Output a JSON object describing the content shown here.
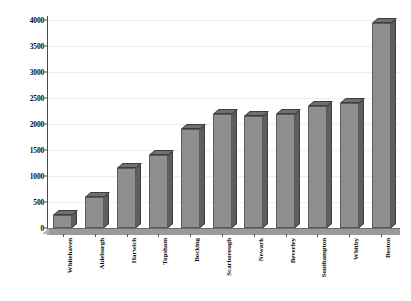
{
  "chart_data": {
    "type": "bar",
    "title": "",
    "subtitle": "",
    "xlabel": "",
    "ylabel": "",
    "categories": [
      "Whitehaven",
      "Aldeburgh",
      "Harwich",
      "Topsham",
      "Bocking",
      "Scarborough",
      "Newark",
      "Beverley",
      "Southampton",
      "Whitby",
      "Boston"
    ],
    "values": [
      250,
      600,
      1150,
      1400,
      1900,
      2200,
      2150,
      2200,
      2350,
      2400,
      3950
    ],
    "ylim": [
      0,
      4000
    ],
    "ytick_values": [
      0,
      500,
      1000,
      1500,
      2000,
      2500,
      3000,
      3500,
      4000
    ],
    "ytick_labels": [
      "0",
      "500",
      "1000",
      "1500",
      "2000",
      "2500",
      "3000",
      "3500",
      "4000"
    ],
    "grid": true,
    "legend": false,
    "legend_position": "none",
    "style": "3d-column",
    "colors": {
      "bar_front": "#8f8f8f",
      "bar_side": "#5e5e5e",
      "bar_top": "#6f6f6f",
      "bar_outline": "#3d3d3d",
      "floor": "#9a9a9a",
      "axis": "#4a4a4a",
      "gridline": "#eeeeee",
      "background": "#ffffff",
      "text": "#111111"
    }
  }
}
